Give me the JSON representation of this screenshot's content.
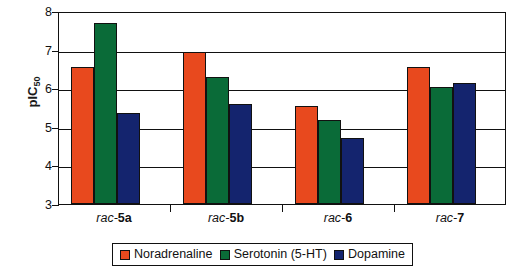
{
  "chart_data": {
    "type": "bar",
    "title": "",
    "xlabel": "",
    "ylabel": "pIC50",
    "ylabel_base": "pIC",
    "ylabel_sub": "50",
    "ylim": [
      3,
      8
    ],
    "yticks": [
      3,
      4,
      5,
      6,
      7,
      8
    ],
    "ytick_labels": [
      "3",
      "4",
      "5",
      "6",
      "7",
      "8"
    ],
    "grid": true,
    "legend_position": "bottom",
    "categories": [
      "rac-5a",
      "rac-5b",
      "rac-6",
      "rac-7"
    ],
    "category_parts": [
      {
        "italic": "rac-",
        "bold": "5a"
      },
      {
        "italic": "rac-",
        "bold": "5b"
      },
      {
        "italic": "rac-",
        "bold": "6"
      },
      {
        "italic": "rac-",
        "bold": "7"
      }
    ],
    "series": [
      {
        "name": "Noradrenaline",
        "color": "#E8491E",
        "values": [
          6.55,
          6.95,
          5.55,
          6.56
        ]
      },
      {
        "name": "Serotonin (5-HT)",
        "color": "#0A6B38",
        "values": [
          7.7,
          6.28,
          5.18,
          6.02
        ]
      },
      {
        "name": "Dopamine",
        "color": "#14246E",
        "values": [
          5.35,
          5.58,
          4.7,
          6.14
        ]
      }
    ]
  },
  "legend": {
    "items": [
      {
        "label": "Noradrenaline",
        "color": "#E8491E"
      },
      {
        "label": "Serotonin (5-HT)",
        "color": "#0A6B38"
      },
      {
        "label": "Dopamine",
        "color": "#14246E"
      }
    ]
  },
  "axis": {
    "y_title_base": "pIC",
    "y_title_sub": "50"
  }
}
